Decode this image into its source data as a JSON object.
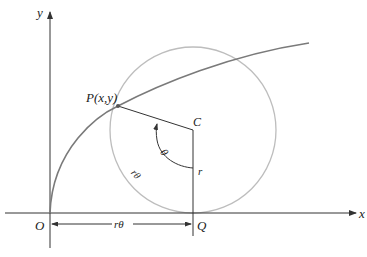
{
  "diagram": {
    "axes": {
      "x_label": "x",
      "y_label": "y",
      "origin_label": "O"
    },
    "points": {
      "P": "P(x,y)",
      "C": "C",
      "Q": "Q"
    },
    "labels": {
      "theta": "θ",
      "arc_length": "rθ",
      "radius": "r",
      "base_length": "rθ"
    },
    "colors": {
      "axis": "#333333",
      "curve": "#777777",
      "circle": "#bbbbbb",
      "segment": "#333333"
    }
  }
}
